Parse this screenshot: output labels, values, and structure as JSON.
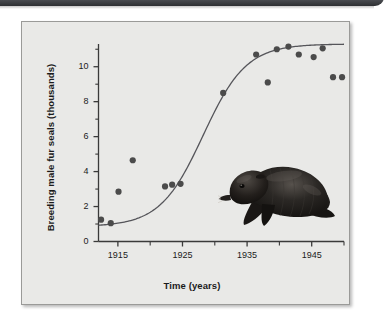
{
  "page": {
    "background_color": "#ffffff",
    "panel_color": "#e9e9e7",
    "panel_border_color": "#9a9a98",
    "header_strip_color": "#53565b"
  },
  "chart_data": {
    "type": "scatter",
    "title": "",
    "subtitle": "",
    "xlabel": "Time (years)",
    "ylabel": "Breeding male fur seals (thousands)",
    "xlim": [
      1912,
      1950
    ],
    "ylim": [
      0,
      11.3
    ],
    "grid": false,
    "legend": "none",
    "x_major_ticks": [
      1915,
      1925,
      1935,
      1945
    ],
    "x_major_tick_labels": [
      "1915",
      "1925",
      "1935",
      "1945"
    ],
    "x_minor_ticks": [
      1920,
      1930,
      1940,
      1950
    ],
    "y_major_ticks": [
      0,
      2,
      4,
      6,
      8,
      10
    ],
    "y_major_tick_labels": [
      "0",
      "2",
      "4",
      "6",
      "8",
      "10"
    ],
    "y_minor_ticks": [
      1,
      3,
      5,
      7,
      9,
      11
    ],
    "marker_color": "#4b4b4b",
    "marker_radius": 3.1,
    "curve_color": "#55555a",
    "curve_width": 1.3,
    "points": [
      {
        "x": 1912.4,
        "y": 1.25
      },
      {
        "x": 1913.9,
        "y": 1.05
      },
      {
        "x": 1915.1,
        "y": 2.85
      },
      {
        "x": 1917.3,
        "y": 4.65
      },
      {
        "x": 1922.3,
        "y": 3.15
      },
      {
        "x": 1923.4,
        "y": 3.25
      },
      {
        "x": 1924.7,
        "y": 3.3
      },
      {
        "x": 1931.3,
        "y": 8.5
      },
      {
        "x": 1936.4,
        "y": 10.7
      },
      {
        "x": 1938.2,
        "y": 9.1
      },
      {
        "x": 1939.6,
        "y": 11.0
      },
      {
        "x": 1941.4,
        "y": 11.15
      },
      {
        "x": 1943.0,
        "y": 10.7
      },
      {
        "x": 1945.3,
        "y": 10.55
      },
      {
        "x": 1946.7,
        "y": 11.05
      },
      {
        "x": 1948.3,
        "y": 9.4
      },
      {
        "x": 1949.7,
        "y": 9.4
      }
    ],
    "fit_curve": {
      "name": "logistic growth fit",
      "L": 10.45,
      "k": 0.3,
      "x0": 1928.2,
      "offset": 0.85
    }
  },
  "seal": {
    "name": "fur-seal-illustration",
    "body_color": "#1c1a18",
    "highlight_color": "#5d5955"
  }
}
